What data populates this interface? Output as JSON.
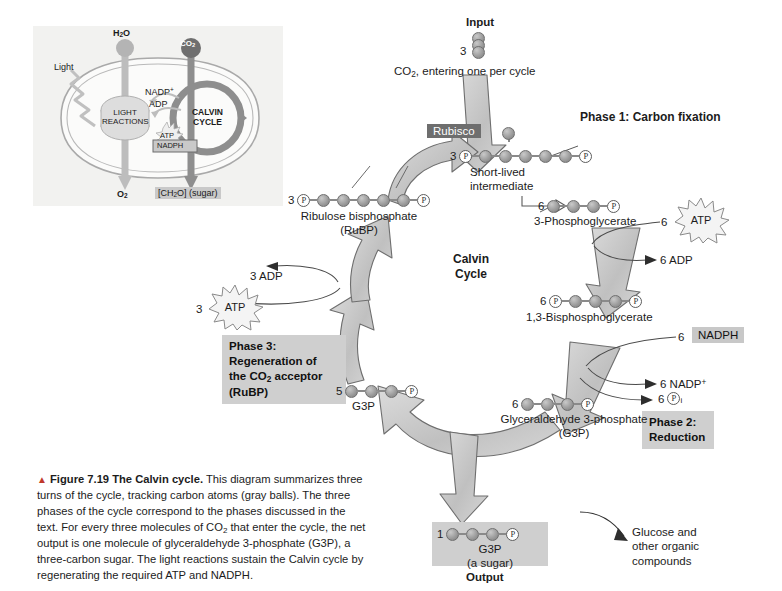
{
  "figure": {
    "marker": "▲",
    "number": "Figure 7.19",
    "title": "The Calvin cycle.",
    "body": "This diagram summarizes three turns of the cycle, tracking carbon atoms (gray balls). The three phases of the cycle correspond to the phases discussed in the text. For every three molecules of CO2 that enter the cycle, the net output is one molecule of glyceraldehyde 3-phosphate (G3P), a three-carbon sugar. The light reactions sustain the Calvin cycle by regenerating the required ATP and NADPH."
  },
  "inset": {
    "h2o": "H2O",
    "co2": "CO2",
    "light": "Light",
    "light_reactions": "LIGHT REACTIONS",
    "calvin_cycle": "CALVIN CYCLE",
    "nadp_plus": "NADP+",
    "adp": "ADP",
    "atp": "ATP",
    "nadph": "NADPH",
    "o2": "O2",
    "sugar": "[CH2O] (sugar)"
  },
  "diagram": {
    "input_label": "Input",
    "input_count": "3",
    "input_caption": "CO2, entering one per cycle",
    "enzyme_label": "Rubisco",
    "center_title_line1": "Calvin",
    "center_title_line2": "Cycle",
    "phase1": "Phase 1: Carbon fixation",
    "phase2_line1": "Phase 2:",
    "phase2_line2": "Reduction",
    "phase3_line1": "Phase 3:",
    "phase3_line2": "Regeneration of",
    "phase3_line3": "the CO2 acceptor",
    "phase3_line4": "(RuBP)",
    "output_label": "Output",
    "glucose_note_line1": "Glucose and",
    "glucose_note_line2": "other organic",
    "glucose_note_line3": "compounds"
  },
  "molecules": {
    "intermediate": {
      "count": "3",
      "name_line1": "Short-lived",
      "name_line2": "intermediate",
      "carbons": 5,
      "phosphates": 2
    },
    "rubp": {
      "count": "3",
      "name_line1": "Ribulose bisphosphate",
      "name_line2": "(RuBP)",
      "carbons": 5,
      "phosphates": 2
    },
    "pga": {
      "count": "6",
      "name": "3-Phosphoglycerate",
      "carbons": 3,
      "phosphates": 1
    },
    "bpg": {
      "count": "6",
      "name": "1,3-Bisphosphoglycerate",
      "carbons": 3,
      "phosphates": 2
    },
    "g3p_right": {
      "count": "6",
      "name_line1": "Glyceraldehyde 3-phosphate",
      "name_line2": "(G3P)",
      "carbons": 3,
      "phosphates": 1
    },
    "g3p_left": {
      "count": "5",
      "name": "G3P",
      "carbons": 3,
      "phosphates": 1
    },
    "g3p_out": {
      "count": "1",
      "name_line1": "G3P",
      "name_line2": "(a sugar)",
      "carbons": 3,
      "phosphates": 1
    }
  },
  "cofactors": {
    "atp_left_count": "3",
    "atp_left": "ATP",
    "adp_left": "3 ADP",
    "atp_right_count": "6",
    "atp_right": "ATP",
    "adp_right": "6 ADP",
    "nadph_count": "6",
    "nadph": "NADPH",
    "nadp_plus": "6 NADP+",
    "pi_count": "6",
    "pi_symbol": "P",
    "pi_sub": "i"
  },
  "glyphs": {
    "phosphate": "P"
  },
  "colors": {
    "carbon_ball": "#9d9d9d",
    "arrow_fill": "#c2c2c2",
    "phase_box": "#cfcfcf",
    "enzyme_box": "#6e6e6e",
    "inset_bg": "#f2f2f0"
  }
}
